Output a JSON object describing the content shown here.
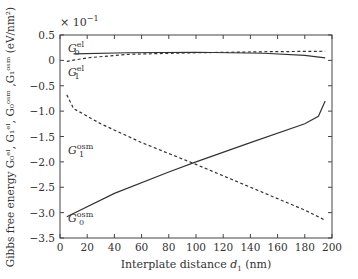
{
  "chart_data": {
    "type": "line",
    "title": "",
    "xlabel": "Interplate distance d1 (nm)",
    "ylabel": "Gibbs free energy G0el, G1el, G0osm, G1osm (eV/nm2)",
    "y_multiplier": "×10^-1",
    "xlim": [
      0,
      200
    ],
    "ylim": [
      -3.5,
      0.5
    ],
    "xticks": [
      0,
      20,
      40,
      60,
      80,
      100,
      120,
      140,
      160,
      180,
      200
    ],
    "yticks": [
      0.5,
      0,
      -0.5,
      -1.0,
      -1.5,
      -2.0,
      -2.5,
      -3.0,
      -3.5
    ],
    "grid": false,
    "series": [
      {
        "name": "G0el",
        "style": "solid",
        "x": [
          10,
          50,
          100,
          150,
          180,
          195
        ],
        "y": [
          0.13,
          0.15,
          0.16,
          0.14,
          0.1,
          0.05
        ]
      },
      {
        "name": "G1el",
        "style": "dashed",
        "x": [
          5,
          20,
          50,
          100,
          150,
          195
        ],
        "y": [
          -0.02,
          0.05,
          0.12,
          0.15,
          0.17,
          0.18
        ]
      },
      {
        "name": "G0osm",
        "style": "solid",
        "x": [
          5,
          40,
          80,
          100,
          140,
          180,
          190,
          195
        ],
        "y": [
          -3.08,
          -2.62,
          -2.2,
          -2.0,
          -1.62,
          -1.25,
          -1.1,
          -0.8
        ]
      },
      {
        "name": "G1osm",
        "style": "dashed",
        "x": [
          5,
          10,
          30,
          60,
          100,
          140,
          180,
          195
        ],
        "y": [
          -0.68,
          -0.95,
          -1.25,
          -1.62,
          -2.05,
          -2.5,
          -2.95,
          -3.15
        ]
      }
    ],
    "annotations": [
      "G0el",
      "G1el",
      "G1osm",
      "G0osm"
    ]
  },
  "labels": {
    "multiplier": "× 10",
    "multiplier_exp": "−1",
    "xlabel_pre": "Interplate distance ",
    "xlabel_var": "d",
    "xlabel_sub": "1",
    "xlabel_post": " (nm)",
    "ylabel": "Gibbs free energy G₀ᵉˡ, G₁ᵉˡ, G₀ᵒˢᵐ ,G₁ᵒˢᵐ (eV/nm²)"
  }
}
